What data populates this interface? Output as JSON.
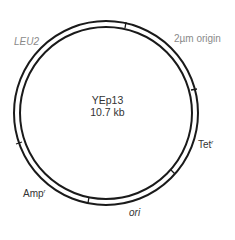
{
  "plasmid": {
    "name": "YEp13",
    "size": "10.7 kb",
    "ring_color": "#1a1a1a",
    "center": [
      106,
      113
    ],
    "outer_radius": 92,
    "inner_radius": 86
  },
  "labels": {
    "leu2": "LEU2",
    "two_micron": "2µm origin",
    "tet": "Tet",
    "tet_sup": "r",
    "amp": "Amp",
    "amp_sup": "r",
    "ori": "ori"
  },
  "segment_boundaries_deg": [
    77,
    10,
    -42,
    -108,
    -165
  ]
}
